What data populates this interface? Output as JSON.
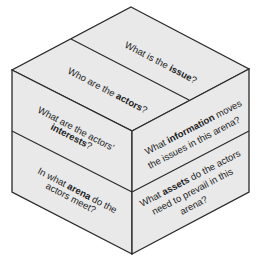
{
  "diagram": {
    "type": "isometric-cube",
    "colors": {
      "face_fill": "#e9e9e9",
      "stroke": "#2a2a2a",
      "text": "#222222",
      "background": "#ffffff"
    },
    "top_face": {
      "panels": [
        {
          "pre": "What is the ",
          "bold": "issue",
          "post": "?"
        },
        {
          "pre": "Who are the ",
          "bold": "actors",
          "post": "?"
        }
      ]
    },
    "left_face": {
      "panels": [
        {
          "line1": "What are the actors'",
          "line2_bold": "interests",
          "line2_post": "?"
        },
        {
          "line1_pre": "In what ",
          "line1_bold": "arena",
          "line1_post": " do the",
          "line2": "actors meet?"
        }
      ]
    },
    "right_face": {
      "panels": [
        {
          "line1_pre": "What ",
          "line1_bold": "information",
          "line1_post": " moves",
          "line2": "the issues in this arena?"
        },
        {
          "line1_pre": "What ",
          "line1_bold": "assets",
          "line1_post": " do the actors",
          "line2": "need to prevail in this",
          "line3": "arena?"
        }
      ]
    }
  }
}
